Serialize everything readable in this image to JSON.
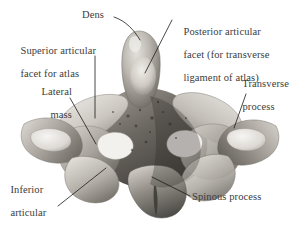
{
  "figure": {
    "background_color": "#ffffff",
    "label_color": "#3c3c3c",
    "leader_color": "#1a1a1a",
    "bone_colors": {
      "light": "#e8e6e2",
      "mid": "#b9b5ae",
      "dark": "#7e7a74",
      "shadow": "#4b4844",
      "deep": "#2e2c29"
    }
  },
  "labels": {
    "dens": {
      "text": "Dens",
      "lines": [
        "Dens"
      ]
    },
    "posterior_articular_facet": {
      "text": "Posterior articular facet (for transverse ligament of atlas)",
      "lines": [
        "Posterior articular",
        "facet (for transverse",
        "ligament of atlas)"
      ]
    },
    "superior_articular_facet": {
      "text": "Superior articular facet for atlas",
      "lines": [
        "Superior articular",
        "facet for atlas"
      ]
    },
    "lateral_mass": {
      "text": "Lateral mass",
      "lines": [
        "Lateral",
        "mass"
      ]
    },
    "transverse_process": {
      "text": "Transverse process",
      "lines": [
        "Transverse",
        "process"
      ]
    },
    "inferior_articular_process": {
      "text": "Inferior articular process",
      "lines": [
        "Inferior",
        "articular",
        "process"
      ]
    },
    "spinous_process": {
      "text": "Spinous process",
      "lines": [
        "Spinous process"
      ]
    }
  }
}
